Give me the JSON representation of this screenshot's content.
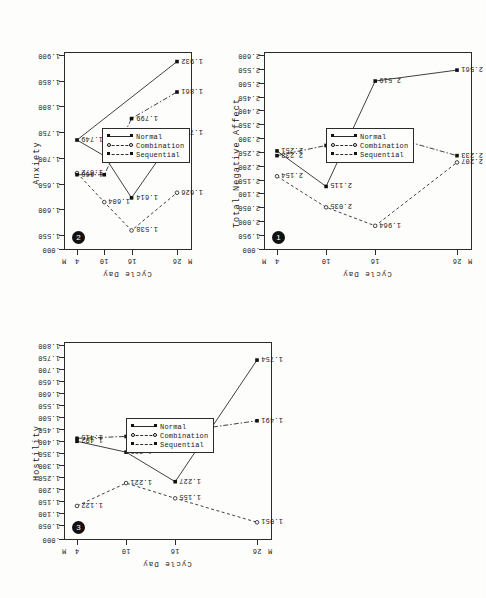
{
  "page": {
    "orientation": "rotated-90",
    "background": "#fdfdfc",
    "ink": "#1a1a1a"
  },
  "shared": {
    "xlabel": "Cycle Day",
    "xticks": [
      "M",
      "4",
      "10",
      "16",
      "26",
      "M"
    ],
    "legend": [
      {
        "name": "Normal",
        "style": "solid",
        "marker": "filled-square"
      },
      {
        "name": "Combination",
        "style": "dashed",
        "marker": "open-circle"
      },
      {
        "name": "Sequential",
        "style": "dash-dot",
        "marker": "filled-square"
      }
    ]
  },
  "chart_data": [
    {
      "id": "panel-1",
      "badge": "1",
      "type": "line",
      "title": "Total Negative Affect",
      "xlabel": "Cycle Day",
      "ylabel": "",
      "x": [
        4,
        10,
        16,
        26
      ],
      "xticklabels": [
        "4",
        "10",
        "16",
        "26"
      ],
      "yticklabels": [
        ".000",
        "1.950",
        "2.000",
        "2.050",
        "2.100",
        "2.150",
        "2.200",
        "2.250",
        "2.300",
        "2.350",
        "2.400",
        "2.450",
        "2.500",
        "2.550",
        "2.600"
      ],
      "ylim": [
        1.925,
        2.615
      ],
      "grid": false,
      "legend_position": "inside-right",
      "series": [
        {
          "name": "Normal",
          "style": "solid",
          "values": [
            2.251,
            2.115,
            2.519,
            2.561
          ],
          "labels": [
            "2.251",
            "2.115",
            "2.519",
            "2.561"
          ]
        },
        {
          "name": "Combination",
          "style": "dashed",
          "values": [
            2.154,
            2.035,
            1.964,
            2.207
          ],
          "labels": [
            "2.154",
            "2.035",
            "1.964",
            "2.207"
          ]
        },
        {
          "name": "Sequential",
          "style": "dash-dot",
          "values": [
            2.233,
            2.272,
            2.322,
            2.233
          ],
          "labels": [
            "2.233",
            "2.272",
            "2.322",
            "2.233"
          ]
        }
      ]
    },
    {
      "id": "panel-2",
      "badge": "2",
      "type": "line",
      "title": "Anxiety",
      "xlabel": "Cycle Day",
      "ylabel": "",
      "x": [
        4,
        10,
        16,
        26
      ],
      "xticklabels": [
        "4",
        "10",
        "16",
        "26"
      ],
      "yticklabels": [
        ".000",
        "1.550",
        "1.600",
        "1.650",
        "1.700",
        "1.750",
        "1.800",
        "1.850",
        "1.900"
      ],
      "ylim": [
        1.525,
        1.945
      ],
      "grid": false,
      "legend_position": "inside-right",
      "series": [
        {
          "name": "Normal",
          "style": "solid",
          "values": [
            1.749,
            1.712,
            1.614,
            1.766
          ],
          "labels": [
            "1.749",
            "1.712",
            "1.614",
            "1.766"
          ]
        },
        {
          "name": "Combination",
          "style": "dashed",
          "values": [
            1.672,
            1.604,
            1.538,
            1.626
          ],
          "labels": [
            "1.672",
            "1.604",
            "1.538",
            "1.626"
          ]
        },
        {
          "name": "Sequential",
          "style": "dash-dot",
          "values": [
            1.668,
            1.668,
            1.799,
            1.861
          ],
          "labels": [
            "1.668",
            "",
            "1.799",
            "1.861"
          ]
        }
      ],
      "extra_points": [
        {
          "label": "1.932",
          "x": 26,
          "y": 1.932,
          "series": "Normal"
        }
      ]
    },
    {
      "id": "panel-3",
      "badge": "3",
      "type": "line",
      "title": "Hostility",
      "xlabel": "Cycle Day",
      "ylabel": "",
      "x": [
        4,
        10,
        16,
        26
      ],
      "xticklabels": [
        "4",
        "10",
        "16",
        "26"
      ],
      "yticklabels": [
        ".000",
        "1.050",
        "1.100",
        "1.150",
        "1.200",
        "1.250",
        "1.300",
        "1.350",
        "1.400",
        "1.450",
        "1.500",
        "1.550",
        "1.600",
        "1.650",
        "1.700",
        "1.750",
        "1.800"
      ],
      "ylim": [
        1.035,
        1.815
      ],
      "grid": false,
      "legend_position": "inside-right",
      "series": [
        {
          "name": "Normal",
          "style": "solid",
          "values": [
            1.402,
            1.355,
            1.227,
            1.754
          ],
          "labels": [
            "1.402",
            "1.355",
            "1.227",
            "1.754"
          ]
        },
        {
          "name": "Combination",
          "style": "dashed",
          "values": [
            1.122,
            1.221,
            1.155,
            1.051
          ],
          "labels": [
            "1.122",
            "1.221",
            "1.155",
            "1.051"
          ]
        },
        {
          "name": "Sequential",
          "style": "dash-dot",
          "values": [
            1.415,
            1.423,
            1.441,
            1.491
          ],
          "labels": [
            "1.415",
            "1.423",
            "1.441",
            "1.491"
          ]
        }
      ]
    }
  ]
}
